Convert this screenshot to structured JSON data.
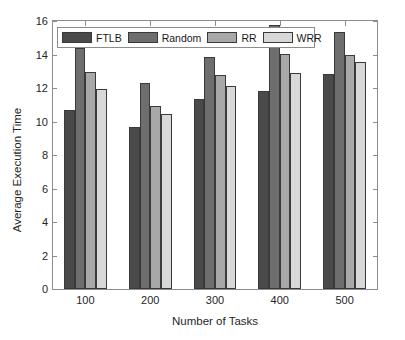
{
  "chart_data": {
    "type": "bar",
    "title": "",
    "xlabel": "Number of Tasks",
    "ylabel": "Average Execution Time",
    "categories": [
      "100",
      "200",
      "300",
      "400",
      "500"
    ],
    "ylim": [
      0,
      16
    ],
    "yticks": [
      0,
      2,
      4,
      6,
      8,
      10,
      12,
      14,
      16
    ],
    "grid": false,
    "legend_position": "top-left-inside",
    "series": [
      {
        "name": "FTLB",
        "color": "#4a4a4a",
        "values": [
          10.7,
          9.7,
          11.35,
          11.85,
          12.85
        ]
      },
      {
        "name": "Random",
        "color": "#6e6e6e",
        "values": [
          14.4,
          12.3,
          13.85,
          15.75,
          15.35
        ]
      },
      {
        "name": "RR",
        "color": "#a8a8a8",
        "values": [
          12.95,
          10.95,
          12.8,
          14.05,
          14.0
        ]
      },
      {
        "name": "WRR",
        "color": "#d8d8d8",
        "values": [
          11.95,
          10.45,
          12.1,
          12.9,
          13.55
        ]
      }
    ]
  },
  "axes": {
    "ytick_labels": [
      "0",
      "2",
      "4",
      "6",
      "8",
      "10",
      "12",
      "14",
      "16"
    ],
    "xtick_labels": [
      "100",
      "200",
      "300",
      "400",
      "500"
    ]
  }
}
